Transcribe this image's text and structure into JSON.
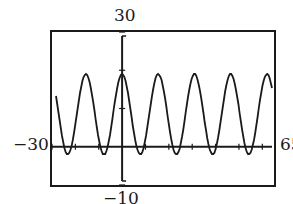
{
  "chart_data": {
    "type": "line",
    "title": "",
    "xlabel": "",
    "ylabel": "",
    "window": {
      "xmin": -30,
      "xmax": 65,
      "ymin": -10,
      "ymax": 30
    },
    "xlim": [
      -30,
      65
    ],
    "ylim": [
      -10,
      30
    ],
    "grid": false,
    "legend": null,
    "tick_labels": {
      "top": "30",
      "bottom": "−10",
      "left": "−30",
      "right": "65"
    },
    "series": [
      {
        "name": "f(x)",
        "description": "periodic (sinusoidal) curve, max ≈ 19, min ≈ -2, period ≈ 15.5, peak at x ≈ 0",
        "model": {
          "midline": 8.5,
          "amplitude": 10.5,
          "period": 15.5,
          "phase_peak_x": 0
        },
        "x": [
          -30,
          -22.25,
          -15.5,
          -7.75,
          0,
          7.75,
          15.5,
          23.25,
          31,
          38.75,
          46.5,
          54.25,
          62,
          65
        ],
        "y": [
          15,
          -2,
          19,
          -2,
          19,
          -2,
          19,
          -2,
          19,
          -2,
          19,
          -2,
          19,
          17
        ]
      }
    ]
  },
  "labels": {
    "ymax": "30",
    "ymin": "−10",
    "xmin": "−30",
    "xmax": "65"
  },
  "colors": {
    "ink": "#1a1a1a",
    "background": "#ffffff"
  }
}
